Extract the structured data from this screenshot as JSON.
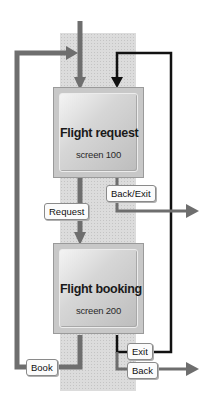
{
  "diagram": {
    "type": "screen-flow",
    "screens": [
      {
        "id": "s100",
        "title": "Flight request",
        "subtitle": "screen 100"
      },
      {
        "id": "s200",
        "title": "Flight booking",
        "subtitle": "screen 200"
      }
    ],
    "transitions": [
      {
        "label": "Request",
        "from": "Flight request",
        "to": "Flight booking"
      },
      {
        "label": "Back/Exit",
        "from": "Flight request",
        "to": "exit (right)"
      },
      {
        "label": "Book",
        "from": "Flight booking",
        "to": "Flight request"
      },
      {
        "label": "Exit",
        "from": "Flight booking",
        "to": "Flight request"
      },
      {
        "label": "Back",
        "from": "Flight booking",
        "to": "exit (right)"
      }
    ],
    "colors": {
      "gray_arrow": "#6e6e6e",
      "black_arrow": "#111111",
      "strip": "#dcdcdc",
      "box": "#c8c8c8"
    }
  }
}
